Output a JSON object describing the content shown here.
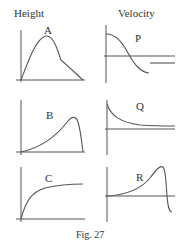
{
  "headers": {
    "left": "Height",
    "right": "Velocity"
  },
  "graphs": [
    {
      "id": "A",
      "label": "A",
      "quantity": "Height",
      "shape": "rise to peak, shoulder, then linear fall to zero"
    },
    {
      "id": "P",
      "label": "P",
      "quantity": "Velocity",
      "shape": "positive start, smooth fall through zero to negative, then constant negative segment"
    },
    {
      "id": "B",
      "label": "B",
      "quantity": "Height",
      "shape": "slow rise to late peak then sharp drop to zero"
    },
    {
      "id": "Q",
      "label": "Q",
      "quantity": "Velocity",
      "shape": "exponential decay toward small positive constant"
    },
    {
      "id": "C",
      "label": "C",
      "quantity": "Height",
      "shape": "rapid rise leveling off (saturating)"
    },
    {
      "id": "R",
      "label": "R",
      "quantity": "Velocity",
      "shape": "slow rise to peak then sharp drop below zero"
    }
  ],
  "caption": "Fig. 27",
  "colors": {
    "stroke": "#555555",
    "text": "#333333",
    "background": "#ffffff"
  }
}
